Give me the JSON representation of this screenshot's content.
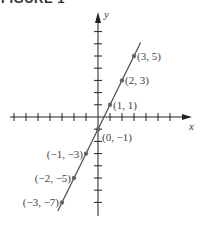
{
  "figure_label": "FIGURE 1",
  "chart_data": {
    "type": "line",
    "title": "FIGURE 1",
    "xlabel": "x",
    "ylabel": "y",
    "equation_implied": "y = 2x - 1",
    "points": [
      {
        "x": 3,
        "y": 5,
        "label": "(3, 5)"
      },
      {
        "x": 2,
        "y": 3,
        "label": "(2, 3)"
      },
      {
        "x": 1,
        "y": 1,
        "label": "(1, 1)"
      },
      {
        "x": 0,
        "y": -1,
        "label": "(0, −1)"
      },
      {
        "x": -1,
        "y": -3,
        "label": "(−1, −3)"
      },
      {
        "x": -2,
        "y": -5,
        "label": "(−2, −5)"
      },
      {
        "x": -3,
        "y": -7,
        "label": "(−3, −7)"
      }
    ],
    "xlim": [
      -7,
      8
    ],
    "ylim": [
      -8,
      8
    ],
    "grid": false,
    "tick_marks": true,
    "tick_labels": false,
    "line_color": "#555555",
    "point_color": "#666666",
    "axis_color": "#222222"
  }
}
